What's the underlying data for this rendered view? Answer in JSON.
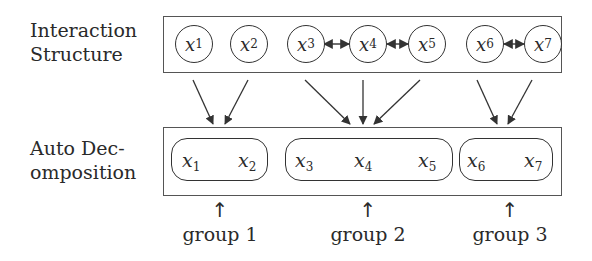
{
  "rows": {
    "top": {
      "label_line1": "Interaction",
      "label_line2": "Structure"
    },
    "bottom": {
      "label_line1": "Auto Dec-",
      "label_line2": "omposition"
    }
  },
  "nodes": [
    {
      "var": "x",
      "sub": "1"
    },
    {
      "var": "x",
      "sub": "2"
    },
    {
      "var": "x",
      "sub": "3"
    },
    {
      "var": "x",
      "sub": "4"
    },
    {
      "var": "x",
      "sub": "5"
    },
    {
      "var": "x",
      "sub": "6"
    },
    {
      "var": "x",
      "sub": "7"
    }
  ],
  "interactions": [
    {
      "from": "x3",
      "to": "x4",
      "type": "bidirectional"
    },
    {
      "from": "x4",
      "to": "x5",
      "type": "bidirectional"
    },
    {
      "from": "x6",
      "to": "x7",
      "type": "bidirectional"
    }
  ],
  "groups": [
    {
      "label": "group 1",
      "members": [
        "x1",
        "x2"
      ],
      "arrow": "↑"
    },
    {
      "label": "group 2",
      "members": [
        "x3",
        "x4",
        "x5"
      ],
      "arrow": "↑"
    },
    {
      "label": "group 3",
      "members": [
        "x6",
        "x7"
      ],
      "arrow": "↑"
    }
  ],
  "colors": {
    "stroke": "#333333",
    "box": "#555555",
    "text": "#2a2a2a"
  }
}
